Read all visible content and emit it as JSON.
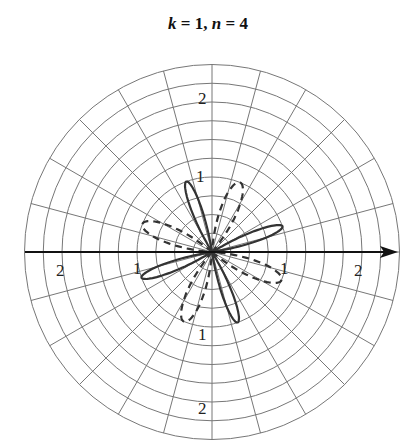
{
  "chart_data": {
    "type": "polar_line",
    "title": "k = 1, n = 4",
    "title_parts": {
      "k_var": "k",
      "k_val": " = 1, ",
      "n_var": "n",
      "n_val": " = 4"
    },
    "grid": true,
    "radial_range": [
      0,
      2.5
    ],
    "radial_ring_step": 0.25,
    "angular_spoke_step_deg": 15,
    "radial_tick_labels": [
      {
        "text": "2",
        "r": 2,
        "angle_deg": 90
      },
      {
        "text": "1",
        "r": 1,
        "angle_deg": 95
      },
      {
        "text": "2",
        "r": 2,
        "angle_deg": 180
      },
      {
        "text": "1",
        "r": 1,
        "angle_deg": 180
      },
      {
        "text": "1",
        "r": 1,
        "angle_deg": 0
      },
      {
        "text": "2",
        "r": 2,
        "angle_deg": 0
      },
      {
        "text": "1",
        "r": 1,
        "angle_deg": 270
      },
      {
        "text": "2",
        "r": 2,
        "angle_deg": 270
      }
    ],
    "series": [
      {
        "name": "solid rose",
        "style": "solid",
        "petals": 4,
        "petal_length": 1.0,
        "petal_angles_deg": [
          20,
          110,
          200,
          290
        ],
        "petal_half_width_deg": 11
      },
      {
        "name": "dashed rose",
        "style": "dashed",
        "petals": 4,
        "petal_length": 1.0,
        "petal_angles_deg": [
          68,
          158,
          248,
          338
        ],
        "petal_half_width_deg": 18
      }
    ],
    "colors": {
      "grid": "#777777",
      "curve": "#333333",
      "axis": "#111111"
    }
  }
}
